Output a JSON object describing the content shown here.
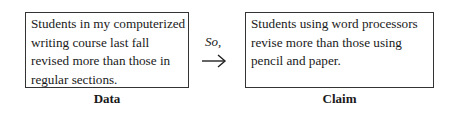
{
  "data_box": {
    "text": "Students in my computerized writing course last fall revised more than those in regular sections.",
    "label": "Data"
  },
  "connector": {
    "text": "So,",
    "icon": "right-arrow-icon"
  },
  "claim_box": {
    "text": "Students using word processors revise more than those using pencil and paper.",
    "label": "Claim"
  }
}
